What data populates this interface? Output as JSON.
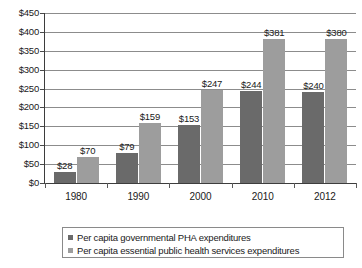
{
  "chart_data": {
    "type": "bar",
    "title": "",
    "subtitle": "",
    "xlabel": "",
    "ylabel": "",
    "categories": [
      "1980",
      "1990",
      "2000",
      "2010",
      "2012"
    ],
    "series": [
      {
        "name": "Per capita governmental PHA expenditures",
        "color": "#6a6a6a",
        "values": [
          28,
          79,
          153,
          244,
          240
        ],
        "labels": [
          "$28",
          "$79",
          "$153",
          "$244",
          "$240"
        ]
      },
      {
        "name": "Per capita essential public health services expenditures",
        "color": "#9d9d9d",
        "values": [
          70,
          159,
          247,
          381,
          380
        ],
        "labels": [
          "$70",
          "$159",
          "$247",
          "$381",
          "$380"
        ]
      }
    ],
    "ylim": [
      0,
      450
    ],
    "ytick_values": [
      0,
      50,
      100,
      150,
      200,
      250,
      300,
      350,
      400,
      450
    ],
    "ytick_labels": [
      "$0",
      "$50",
      "$100",
      "$150",
      "$200",
      "$250",
      "$300",
      "$350",
      "$400",
      "$450"
    ],
    "grid": true,
    "grid_axis": "y",
    "legend_position": "bottom",
    "value_labels_shown": true
  },
  "legend": {
    "items": [
      {
        "label": "Per capita governmental PHA expenditures"
      },
      {
        "label": "Per capita essential public health services expenditures"
      }
    ]
  }
}
